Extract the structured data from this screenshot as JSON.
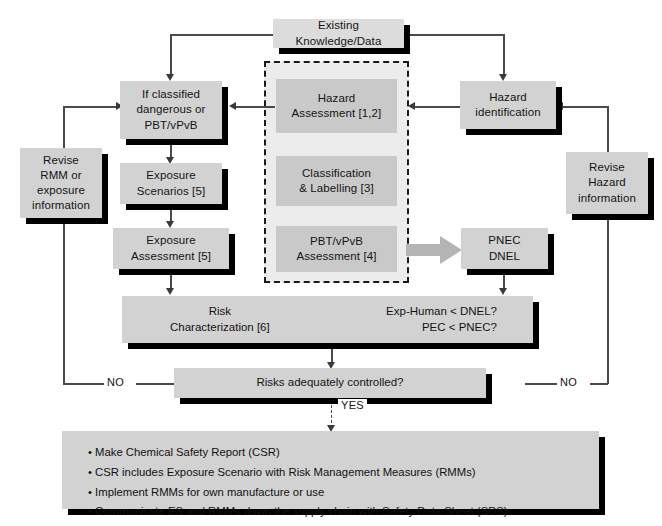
{
  "diagram": {
    "colors": {
      "box_fill": "#d2d2d2",
      "box_fill_light": "#dcdcdc",
      "inner_box_fill": "#c9c9c9",
      "dashed_zone_fill": "#ececec",
      "shadow": "#000000",
      "connector": "#4a4a4a",
      "text": "#141414",
      "background": "#ffffff"
    },
    "nodes": {
      "existing_knowledge": "Existing Knowledge/Data",
      "if_classified": "If classified\ndangerous or\nPBT/vPvB",
      "if_classified_lines": [
        "If classified",
        "dangerous or",
        "PBT/vPvB"
      ],
      "hazard_assessment": [
        "Hazard",
        "Assessment [1,2]"
      ],
      "classification_labelling": [
        "Classification",
        "& Labelling [3]"
      ],
      "pbt_vpvb_assessment": [
        "PBT/vPvB",
        "Assessment [4]"
      ],
      "hazard_identification": [
        "Hazard",
        "identification"
      ],
      "pnec_dnel": [
        "PNEC",
        "DNEL"
      ],
      "revise_rmm": [
        "Revise",
        "RMM or",
        "exposure",
        "information"
      ],
      "revise_hazard": [
        "Revise",
        "Hazard",
        "information"
      ],
      "exposure_scenarios": [
        "Exposure",
        "Scenarios [5]"
      ],
      "exposure_assessment": [
        "Exposure",
        "Assessment [5]"
      ],
      "risk_characterization": [
        "Risk",
        "Characterization [6]"
      ],
      "risk_criteria": [
        "Exp-Human < DNEL?",
        "PEC < PNEC?"
      ],
      "risks_controlled": "Risks adequately controlled?",
      "outcome_bullets": [
        "Make Chemical Safety Report (CSR)",
        "CSR includes Exposure Scenario with Risk Management Measures (RMMs)",
        "Implement RMMs for own manufacture or use",
        "Communicate ES and RMMs down the supply chain with Safety Data Sheet (SDS)"
      ]
    },
    "edge_labels": {
      "no_left": "NO",
      "no_right": "NO",
      "yes": "YES"
    }
  }
}
